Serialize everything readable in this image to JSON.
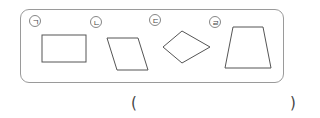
{
  "problem": {
    "items": [
      {
        "label": "ㄱ",
        "shape": "rectangle"
      },
      {
        "label": "ㄴ",
        "shape": "parallelogram"
      },
      {
        "label": "ㄷ",
        "shape": "rhombus"
      },
      {
        "label": "ㄹ",
        "shape": "trapezoid"
      }
    ],
    "answer": {
      "open_paren": "(",
      "close_paren": ")",
      "value": ""
    }
  },
  "colors": {
    "stroke": "#555555",
    "frame": "#9a9a9a"
  }
}
